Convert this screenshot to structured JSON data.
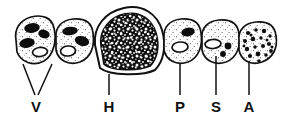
{
  "figure": {
    "kind": "biological-line-drawing",
    "background_color": "#ffffff",
    "ink_color": "#111111",
    "width": 285,
    "height": 120
  },
  "labels": [
    {
      "id": "V",
      "text": "V",
      "x": 36,
      "y": 112,
      "leader_type": "double",
      "leader_points": [
        [
          23,
          66,
          36,
          98
        ],
        [
          52,
          66,
          36,
          98
        ]
      ]
    },
    {
      "id": "H",
      "text": "H",
      "x": 109,
      "y": 112,
      "leader_type": "single",
      "leader_points": [
        [
          109,
          74,
          109,
          98
        ]
      ]
    },
    {
      "id": "P",
      "text": "P",
      "x": 180,
      "y": 112,
      "leader_type": "single",
      "leader_points": [
        [
          180,
          64,
          180,
          98
        ]
      ]
    },
    {
      "id": "S",
      "text": "S",
      "x": 216,
      "y": 112,
      "leader_type": "single",
      "leader_points": [
        [
          216,
          57,
          216,
          98
        ]
      ]
    },
    {
      "id": "A",
      "text": "A",
      "x": 249,
      "y": 112,
      "leader_type": "single",
      "leader_points": [
        [
          249,
          62,
          249,
          98
        ]
      ]
    }
  ],
  "cells": [
    {
      "id": "cell-v1",
      "label_ref": "V",
      "outline": "M 16,40 C 14,29 20,20 31,17 C 43,14 52,18 54,28 C 57,40 54,55 44,61 C 33,67 21,62 17,52 Z",
      "fill": "#ffffff",
      "stipple": true,
      "dark_ovals": [
        {
          "cx": 32,
          "cy": 28,
          "rx": 7,
          "ry": 4,
          "rot": -8
        },
        {
          "cx": 44,
          "cy": 34,
          "rx": 5,
          "ry": 3.5,
          "rot": 18
        },
        {
          "cx": 27,
          "cy": 43,
          "rx": 7,
          "ry": 4,
          "rot": -12
        }
      ],
      "open_ovals": [
        {
          "cx": 40,
          "cy": 52,
          "rx": 7.5,
          "ry": 4.5,
          "rot": -6
        }
      ]
    },
    {
      "id": "cell-v2",
      "label_ref": "V",
      "outline": "M 56,38 C 55,27 62,20 73,19 C 85,18 92,23 93,33 C 95,46 91,58 80,62 C 68,66 58,60 56,50 Z",
      "fill": "#ffffff",
      "stipple": true,
      "dark_ovals": [
        {
          "cx": 70,
          "cy": 31,
          "rx": 7,
          "ry": 3.5,
          "rot": -6
        },
        {
          "cx": 82,
          "cy": 41,
          "rx": 6.5,
          "ry": 4,
          "rot": 15
        }
      ],
      "open_ovals": [
        {
          "cx": 68,
          "cy": 51,
          "rx": 7.5,
          "ry": 5,
          "rot": -4
        }
      ]
    },
    {
      "id": "cell-h",
      "label_ref": "H",
      "outline": "M 95,45 C 93,27 105,12 124,8 C 143,4 157,14 162,30 C 167,47 163,62 155,70 C 143,76 110,76 100,68 Z",
      "inner_outline": "M 101,45 C 99,30 110,17 125,14 C 141,11 152,20 156,33 C 160,47 157,59 150,66 C 139,71 111,71 104,64 Z",
      "fill": "#ffffff",
      "interior": "dense-black-mottled",
      "stipple": false,
      "dark_ovals": [],
      "open_ovals": []
    },
    {
      "id": "cell-p",
      "label_ref": "P",
      "outline": "M 164,38 C 163,27 170,20 181,19 C 193,18 200,23 201,33 C 203,45 199,58 188,62 C 176,66 166,60 164,50 Z",
      "fill": "#ffffff",
      "stipple": true,
      "dark_ovals": [
        {
          "cx": 188,
          "cy": 32,
          "rx": 6,
          "ry": 3.5,
          "rot": -10
        }
      ],
      "open_ovals": [
        {
          "cx": 180,
          "cy": 47,
          "rx": 8,
          "ry": 5,
          "rot": -4
        }
      ]
    },
    {
      "id": "cell-s",
      "label_ref": "S",
      "outline": "M 202,38 C 201,28 208,21 219,20 C 231,19 238,24 239,34 C 241,46 237,58 226,62 C 214,66 204,60 202,50 Z",
      "fill": "#ffffff",
      "stipple": true,
      "dark_ovals": [
        {
          "cx": 228,
          "cy": 46,
          "rx": 3.5,
          "ry": 3,
          "rot": 0
        },
        {
          "cx": 223,
          "cy": 54,
          "rx": 3,
          "ry": 2.5,
          "rot": 0
        }
      ],
      "open_ovals": [
        {
          "cx": 213,
          "cy": 44,
          "rx": 8,
          "ry": 4.5,
          "rot": -4
        }
      ]
    },
    {
      "id": "cell-a",
      "label_ref": "A",
      "outline": "M 239,40 C 238,30 245,23 256,22 C 268,21 275,26 276,36 C 278,48 273,58 262,62 C 250,66 241,60 239,50 Z",
      "fill": "#ffffff",
      "stipple": true,
      "granules": [
        [
          248,
          33
        ],
        [
          256,
          30
        ],
        [
          264,
          31
        ],
        [
          270,
          36
        ],
        [
          245,
          41
        ],
        [
          253,
          39
        ],
        [
          261,
          38
        ],
        [
          269,
          44
        ],
        [
          247,
          49
        ],
        [
          255,
          47
        ],
        [
          263,
          46
        ],
        [
          271,
          51
        ],
        [
          250,
          56
        ],
        [
          258,
          54
        ],
        [
          266,
          55
        ],
        [
          259,
          61
        ],
        [
          251,
          35
        ],
        [
          267,
          40
        ],
        [
          244,
          46
        ],
        [
          272,
          47
        ]
      ],
      "dark_ovals": [],
      "open_ovals": []
    }
  ]
}
